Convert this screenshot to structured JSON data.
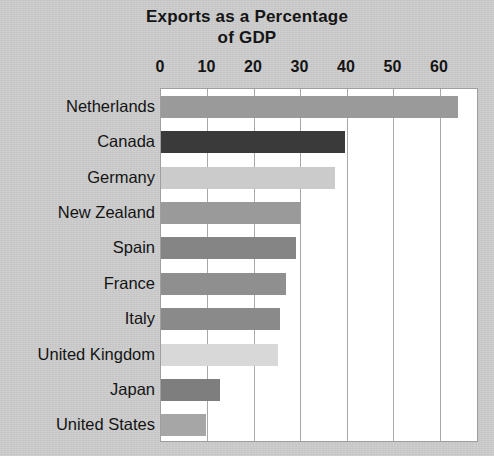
{
  "chart_data": {
    "type": "bar",
    "orientation": "horizontal",
    "title": "Exports as a Percentage of GDP",
    "title_lines": [
      "Exports as a Percentage",
      "of GDP"
    ],
    "xlabel": "",
    "ylabel": "",
    "xlim": [
      0,
      68.4
    ],
    "xticks": [
      0,
      10,
      20,
      30,
      40,
      50,
      60
    ],
    "xtick_labels": [
      "0",
      "10",
      "20",
      "30",
      "40",
      "50",
      "60"
    ],
    "grid": true,
    "grid_axis": "x",
    "legend": false,
    "categories": [
      "Netherlands",
      "Canada",
      "Germany",
      "New Zealand",
      "Spain",
      "France",
      "Italy",
      "United Kingdom",
      "Japan",
      "United States"
    ],
    "values": [
      63.9,
      39.5,
      37.4,
      30.1,
      29.0,
      26.9,
      25.6,
      25.2,
      12.7,
      9.7
    ],
    "bar_colors": [
      "#9a9a9a",
      "#3a3a3a",
      "#cbcbcb",
      "#9a9a9a",
      "#858585",
      "#8f8f8f",
      "#8a8a8a",
      "#d8d8d8",
      "#7e7e7e",
      "#a6a6a6"
    ],
    "plot_background": "#ffffff",
    "figure_background": "#c9c9c9",
    "gridline_color": "#a8a8a8",
    "text_color": "#141414"
  }
}
